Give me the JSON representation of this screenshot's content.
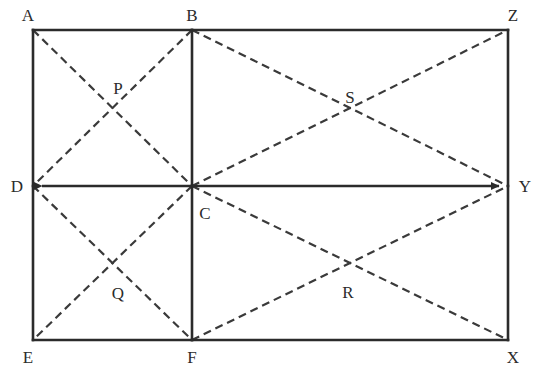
{
  "figure": {
    "type": "geometry-diagram",
    "width": 544,
    "height": 383,
    "background_color": "#ffffff",
    "solid_line_color": "#2b2b2b",
    "dashed_line_color": "#3a3a3a",
    "solid_line_width": 2.6,
    "dashed_line_width": 2.2,
    "dash_pattern": "8 5",
    "label_color": "#2b2b2b",
    "label_font_size": 17
  },
  "points": {
    "A": {
      "name": "A",
      "x": 33,
      "y": 30,
      "label_x": 28,
      "label_y": 15
    },
    "B": {
      "name": "B",
      "x": 192,
      "y": 30,
      "label_x": 192,
      "label_y": 15
    },
    "Z": {
      "name": "Z",
      "x": 508,
      "y": 30,
      "label_x": 513,
      "label_y": 15
    },
    "D": {
      "name": "D",
      "x": 33,
      "y": 186,
      "label_x": 17,
      "label_y": 186
    },
    "C": {
      "name": "C",
      "x": 192,
      "y": 186,
      "label_x": 205,
      "label_y": 213
    },
    "Y": {
      "name": "Y",
      "x": 508,
      "y": 186,
      "label_x": 525,
      "label_y": 186
    },
    "E": {
      "name": "E",
      "x": 33,
      "y": 340,
      "label_x": 28,
      "label_y": 357
    },
    "F": {
      "name": "F",
      "x": 192,
      "y": 340,
      "label_x": 192,
      "label_y": 357
    },
    "X": {
      "name": "X",
      "x": 508,
      "y": 340,
      "label_x": 513,
      "label_y": 357
    },
    "P": {
      "name": "P",
      "x": 113,
      "y": 108,
      "label_x": 118,
      "label_y": 88
    },
    "S": {
      "name": "S",
      "x": 350,
      "y": 115,
      "label_x": 350,
      "label_y": 97
    },
    "Q": {
      "name": "Q",
      "x": 113,
      "y": 265,
      "label_x": 118,
      "label_y": 293
    },
    "R": {
      "name": "R",
      "x": 350,
      "y": 272,
      "label_x": 348,
      "label_y": 292
    }
  },
  "solid_segments": [
    {
      "name": "top-edge-A-B",
      "from": "A",
      "to": "B"
    },
    {
      "name": "top-edge-B-Z",
      "from": "B",
      "to": "Z"
    },
    {
      "name": "left-edge-A-D",
      "from": "A",
      "to": "D"
    },
    {
      "name": "left-edge-D-E",
      "from": "D",
      "to": "E"
    },
    {
      "name": "right-edge-Z-Y",
      "from": "Z",
      "to": "Y"
    },
    {
      "name": "right-edge-Y-X",
      "from": "Y",
      "to": "X"
    },
    {
      "name": "bottom-edge-E-F",
      "from": "E",
      "to": "F"
    },
    {
      "name": "bottom-edge-F-X",
      "from": "F",
      "to": "X"
    },
    {
      "name": "vertical-midline-B-C",
      "from": "B",
      "to": "C"
    },
    {
      "name": "vertical-midline-C-F",
      "from": "C",
      "to": "F"
    }
  ],
  "arrow_segments": [
    {
      "name": "horizontal-midline-D-Y",
      "from": "D",
      "to": "Y",
      "arrow_start": true,
      "arrow_end": true
    }
  ],
  "dashed_segments": [
    {
      "name": "diagonal-A-C",
      "from": "A",
      "to": "C",
      "quadrant": "top-left"
    },
    {
      "name": "diagonal-B-D",
      "from": "B",
      "to": "D",
      "quadrant": "top-left"
    },
    {
      "name": "diagonal-B-Y",
      "from": "B",
      "to": "Y",
      "quadrant": "top-right"
    },
    {
      "name": "diagonal-C-Z",
      "from": "C",
      "to": "Z",
      "quadrant": "top-right"
    },
    {
      "name": "diagonal-D-F",
      "from": "D",
      "to": "F",
      "quadrant": "bottom-left"
    },
    {
      "name": "diagonal-C-E",
      "from": "C",
      "to": "E",
      "quadrant": "bottom-left"
    },
    {
      "name": "diagonal-C-X",
      "from": "C",
      "to": "X",
      "quadrant": "bottom-right"
    },
    {
      "name": "diagonal-F-Y",
      "from": "F",
      "to": "Y",
      "quadrant": "bottom-right"
    }
  ],
  "intersection_labels": [
    "P",
    "S",
    "Q",
    "R"
  ],
  "vertex_labels": [
    "A",
    "B",
    "Z",
    "D",
    "C",
    "Y",
    "E",
    "F",
    "X"
  ]
}
